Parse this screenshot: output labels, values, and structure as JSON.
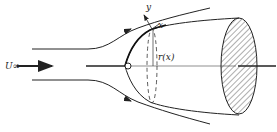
{
  "diagram": {
    "type": "flow around a paraboloid body (axisymmetric)",
    "labels": {
      "freestream": "U∞",
      "y_axis": "y",
      "x_axis": "x",
      "radius": "r(x)"
    },
    "colors": {
      "ink": "#222222",
      "background": "#ffffff"
    }
  }
}
